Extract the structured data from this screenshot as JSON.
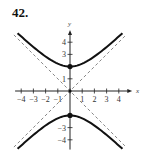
{
  "problem": {
    "number": "42."
  },
  "chart_data": {
    "type": "line",
    "title": "",
    "xlabel": "x",
    "ylabel": "y",
    "xlim": [
      -4.7,
      4.7
    ],
    "ylim": [
      -4.7,
      4.7
    ],
    "grid": false,
    "equation": "y^2/4 - x^2/4 = 1",
    "x_ticks": [
      -4,
      -3,
      -2,
      -1,
      1,
      2,
      3,
      4
    ],
    "x_tick_labels": [
      "-4",
      "-3",
      "-2",
      "-1",
      "1",
      "2",
      "3",
      "4"
    ],
    "y_ticks": [
      -4,
      -3,
      1,
      3,
      4
    ],
    "y_tick_labels": [
      "-4",
      "-3",
      "1",
      "3",
      "4"
    ],
    "series": [
      {
        "name": "upper branch",
        "style": "solid",
        "x": [
          -4.3,
          -4,
          -3,
          -2,
          -1,
          0,
          1,
          2,
          3,
          4,
          4.3
        ],
        "y": [
          4.74,
          4.47,
          3.61,
          2.83,
          2.24,
          2.0,
          2.24,
          2.83,
          3.61,
          4.47,
          4.74
        ]
      },
      {
        "name": "lower branch",
        "style": "solid",
        "x": [
          -4.3,
          -4,
          -3,
          -2,
          -1,
          0,
          1,
          2,
          3,
          4,
          4.3
        ],
        "y": [
          -4.74,
          -4.47,
          -3.61,
          -2.83,
          -2.24,
          -2.0,
          -2.24,
          -2.83,
          -3.61,
          -4.47,
          -4.74
        ]
      },
      {
        "name": "asymptote y = x",
        "style": "dashed",
        "x": [
          -4.6,
          4.6
        ],
        "y": [
          -4.6,
          4.6
        ]
      },
      {
        "name": "asymptote y = -x",
        "style": "dashed",
        "x": [
          -4.6,
          4.6
        ],
        "y": [
          4.6,
          -4.6
        ]
      }
    ],
    "points": [
      {
        "label": "vertex",
        "x": 0,
        "y": 2
      },
      {
        "label": "vertex",
        "x": 0,
        "y": -2
      },
      {
        "label": "center",
        "x": 0,
        "y": 0
      }
    ]
  }
}
